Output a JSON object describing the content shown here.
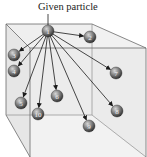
{
  "title": "Given particle",
  "colors": {
    "box_fill_back": "#ececec",
    "box_fill_front": "#e2e2e2",
    "edge": "#555555",
    "arrow": "#1a1a1a",
    "particle_dark": "#3c3c3c",
    "particle_light": "#d8d8d8"
  },
  "given_particle": {
    "label": "1",
    "x": 48,
    "y": 31
  },
  "particles": [
    {
      "label": "2",
      "x": 90,
      "y": 37
    },
    {
      "label": "3",
      "x": 14,
      "y": 55
    },
    {
      "label": "4",
      "x": 14,
      "y": 71
    },
    {
      "label": "5",
      "x": 21,
      "y": 103
    },
    {
      "label": "6",
      "x": 57,
      "y": 96
    },
    {
      "label": "7",
      "x": 116,
      "y": 73
    },
    {
      "label": "8",
      "x": 117,
      "y": 111
    },
    {
      "label": "9",
      "x": 89,
      "y": 126
    },
    {
      "label": "10",
      "x": 38,
      "y": 114
    }
  ]
}
